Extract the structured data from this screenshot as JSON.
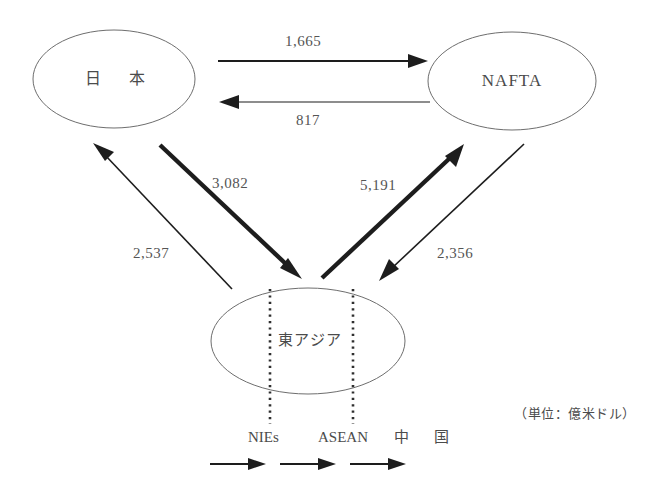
{
  "diagram": {
    "title": "",
    "unit_note": "（単位：億米ドル）",
    "nodes": {
      "japan": {
        "label": "日　本",
        "id": "japan"
      },
      "nafta": {
        "label": "NAFTA",
        "id": "nafta"
      },
      "east_asia": {
        "label": "東アジア",
        "id": "east-asia"
      }
    },
    "segments": [
      {
        "id": "nies",
        "label": "NIEs"
      },
      {
        "id": "asean",
        "label": "ASEAN"
      },
      {
        "id": "china",
        "label": "中　国"
      }
    ],
    "flows": [
      {
        "id": "japan-to-nafta",
        "value": "1,665",
        "from": "japan",
        "to": "nafta",
        "weight": "medium"
      },
      {
        "id": "nafta-to-japan",
        "value": "817",
        "from": "nafta",
        "to": "japan",
        "weight": "hair"
      },
      {
        "id": "japan-to-east-asia",
        "value": "3,082",
        "from": "japan",
        "to": "east_asia",
        "weight": "thick"
      },
      {
        "id": "east-asia-to-japan",
        "value": "2,537",
        "from": "east_asia",
        "to": "japan",
        "weight": "thin"
      },
      {
        "id": "east-asia-to-nafta",
        "value": "5,191",
        "from": "east_asia",
        "to": "nafta",
        "weight": "thick"
      },
      {
        "id": "nafta-to-east-asia",
        "value": "2,356",
        "from": "nafta",
        "to": "east_asia",
        "weight": "thin"
      }
    ],
    "colors": {
      "ellipse_stroke": "#6e6e6e",
      "arrow": "#1d1d1d",
      "text": "#4b4b4b",
      "background": "#ffffff"
    }
  }
}
